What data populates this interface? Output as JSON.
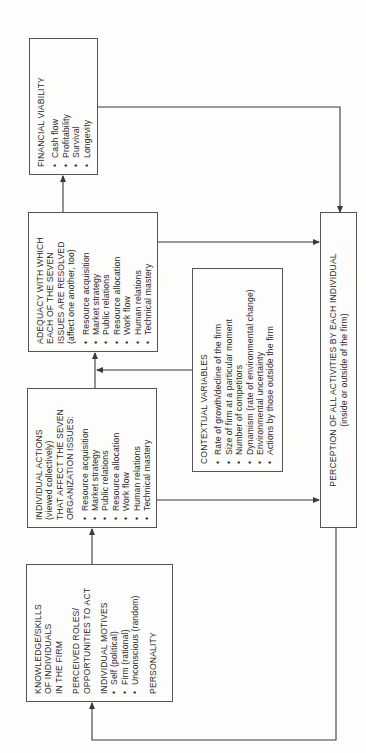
{
  "diagram": {
    "orientation": "rotated 90° counter-clockwise",
    "boxes": {
      "knowledge": {
        "title": "KNOWLEDGE/SKILLS\nOF INDIVIDUALS\nIN THE FIRM",
        "roles": "PERCEIVED ROLES/\nOPPORTUNITIES TO ACT",
        "motives_title": "INDIVIDUAL MOTIVES",
        "motives": [
          "Self (political)",
          "Firm (rational)",
          "Unconscious (random)"
        ],
        "personality": "PERSONALITY"
      },
      "individual_actions": {
        "title": "INDIVIDUAL ACTIONS\n(viewed collectively)\nTHAT AFFECT THE SEVEN\nORGANIZATION ISSUES:",
        "items": [
          "Resource acquisition",
          "Market strategy",
          "Public relations",
          "Resource allocation",
          "Work flow",
          "Human relations",
          "Technical mastery"
        ]
      },
      "adequacy": {
        "title": "ADEQUACY WITH WHICH\nEACH OF THE SEVEN\nISSUES ARE RESOLVED\n(affect one another, too)",
        "items": [
          "Resource acquisition",
          "Market strategy",
          "Public relations",
          "Resource allocation",
          "Work flow",
          "Human relations",
          "Technical mastery"
        ]
      },
      "financial": {
        "title": "FINANCIAL VIABILITY",
        "items": [
          "Cash flow",
          "Profitability",
          "Survival",
          "Longevity"
        ]
      },
      "contextual": {
        "title": "CONTEXTUAL VARIABLES",
        "items": [
          "Rate of growth/decline of the firm",
          "Size of firm at a particular moment",
          "Number of competitors",
          "Dynamism (rate of environmental change)",
          "Environmental uncertainty",
          "Actions by those outside the firm"
        ]
      },
      "perception": {
        "title": "PERCEPTION OF ALL ACTIVITIES BY EACH INDIVIDUAL",
        "subtitle": "(inside or outside of the firm)"
      }
    },
    "connections": [
      {
        "from": "knowledge",
        "to": "individual_actions"
      },
      {
        "from": "individual_actions",
        "to": "adequacy"
      },
      {
        "from": "contextual",
        "to": "individual_actions->adequacy link"
      },
      {
        "from": "adequacy",
        "to": "financial"
      },
      {
        "from": "individual_actions",
        "to": "perception"
      },
      {
        "from": "adequacy",
        "to": "perception"
      },
      {
        "from": "financial",
        "to": "perception"
      },
      {
        "from": "perception",
        "to": "knowledge",
        "type": "feedback loop"
      }
    ],
    "colors": {
      "line": "#3a3a3a",
      "border": "#555555",
      "background": "#fdfdfc",
      "text": "#2a2a2a"
    }
  }
}
